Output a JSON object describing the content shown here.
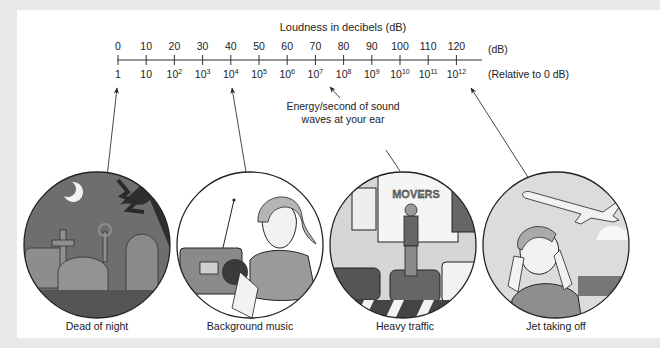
{
  "diagram": {
    "title": "Loudness in decibels (dB)",
    "db_unit_label": "(dB)",
    "relative_label": "(Relative to 0 dB)",
    "ticks": [
      {
        "db": "0",
        "rel_base": "1",
        "rel_exp": ""
      },
      {
        "db": "10",
        "rel_base": "10",
        "rel_exp": ""
      },
      {
        "db": "20",
        "rel_base": "10",
        "rel_exp": "2"
      },
      {
        "db": "30",
        "rel_base": "10",
        "rel_exp": "3"
      },
      {
        "db": "40",
        "rel_base": "10",
        "rel_exp": "4"
      },
      {
        "db": "50",
        "rel_base": "10",
        "rel_exp": "5"
      },
      {
        "db": "60",
        "rel_base": "10",
        "rel_exp": "6"
      },
      {
        "db": "70",
        "rel_base": "10",
        "rel_exp": "7"
      },
      {
        "db": "80",
        "rel_base": "10",
        "rel_exp": "8"
      },
      {
        "db": "90",
        "rel_base": "10",
        "rel_exp": "9"
      },
      {
        "db": "100",
        "rel_base": "10",
        "rel_exp": "10"
      },
      {
        "db": "110",
        "rel_base": "10",
        "rel_exp": "11"
      },
      {
        "db": "120",
        "rel_base": "10",
        "rel_exp": "12"
      }
    ],
    "annotation": {
      "line1": "Energy/second of sound",
      "line2": "waves at your ear"
    },
    "scenes": [
      {
        "label": "Dead of night",
        "points_to_db": "0"
      },
      {
        "label": "Background music",
        "points_to_db": "40"
      },
      {
        "label": "Heavy traffic",
        "points_to_db": "80"
      },
      {
        "label": "Jet taking off",
        "points_to_db": "120"
      }
    ],
    "truck_text": "MOVERS",
    "colors": {
      "line": "#333333",
      "night_sky": "#6b6b6b",
      "tombstone": "#8a8a8a",
      "panel": "#ffffff",
      "margin": "#e9e9e9"
    }
  }
}
